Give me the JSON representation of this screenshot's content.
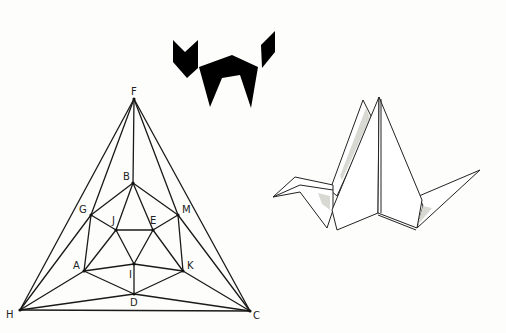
{
  "figures": {
    "cat": {
      "description": "black tangram-style cat silhouette",
      "color": "#000000",
      "head": [
        [
          173,
          40
        ],
        [
          185,
          52
        ],
        [
          198,
          40
        ],
        [
          198,
          68
        ],
        [
          187,
          78
        ],
        [
          173,
          62
        ]
      ],
      "body": [
        [
          199,
          67
        ],
        [
          232,
          55
        ],
        [
          258,
          67
        ],
        [
          251,
          108
        ],
        [
          240,
          75
        ],
        [
          222,
          78
        ],
        [
          210,
          107
        ]
      ],
      "tail": [
        [
          261,
          45
        ],
        [
          275,
          31
        ],
        [
          275,
          52
        ],
        [
          262,
          68
        ]
      ]
    },
    "graph": {
      "description": "planar graph: triangle with nested hexagon",
      "nodes": [
        {
          "id": "F",
          "x": 134,
          "y": 99,
          "lx": 131,
          "ly": 95,
          "label": "F"
        },
        {
          "id": "B",
          "x": 133,
          "y": 183,
          "lx": 123,
          "ly": 180,
          "label": "B"
        },
        {
          "id": "G",
          "x": 91,
          "y": 215,
          "lx": 79,
          "ly": 213,
          "label": "G"
        },
        {
          "id": "M",
          "x": 178,
          "y": 215,
          "lx": 182,
          "ly": 213,
          "label": "M"
        },
        {
          "id": "J",
          "x": 116,
          "y": 230,
          "lx": 112,
          "ly": 224,
          "label": "J"
        },
        {
          "id": "E",
          "x": 153,
          "y": 230,
          "lx": 150,
          "ly": 224,
          "label": "E"
        },
        {
          "id": "A",
          "x": 84,
          "y": 271,
          "lx": 73,
          "ly": 269,
          "label": "A"
        },
        {
          "id": "I",
          "x": 134,
          "y": 264,
          "lx": 129,
          "ly": 278,
          "label": "I"
        },
        {
          "id": "K",
          "x": 183,
          "y": 271,
          "lx": 187,
          "ly": 269,
          "label": "K"
        },
        {
          "id": "D",
          "x": 134,
          "y": 294,
          "lx": 130,
          "ly": 306,
          "label": "D"
        },
        {
          "id": "H",
          "x": 20,
          "y": 310,
          "lx": 6,
          "ly": 318,
          "label": "H"
        },
        {
          "id": "C",
          "x": 250,
          "y": 311,
          "lx": 253,
          "ly": 319,
          "label": "C"
        }
      ],
      "edges": [
        [
          "F",
          "H"
        ],
        [
          "F",
          "C"
        ],
        [
          "H",
          "C"
        ],
        [
          "F",
          "G"
        ],
        [
          "F",
          "B"
        ],
        [
          "F",
          "M"
        ],
        [
          "H",
          "G"
        ],
        [
          "H",
          "A"
        ],
        [
          "H",
          "D"
        ],
        [
          "C",
          "M"
        ],
        [
          "C",
          "K"
        ],
        [
          "C",
          "D"
        ],
        [
          "B",
          "G"
        ],
        [
          "B",
          "M"
        ],
        [
          "B",
          "J"
        ],
        [
          "B",
          "E"
        ],
        [
          "G",
          "J"
        ],
        [
          "G",
          "A"
        ],
        [
          "M",
          "E"
        ],
        [
          "M",
          "K"
        ],
        [
          "J",
          "E"
        ],
        [
          "J",
          "A"
        ],
        [
          "J",
          "I"
        ],
        [
          "E",
          "I"
        ],
        [
          "E",
          "K"
        ],
        [
          "A",
          "I"
        ],
        [
          "A",
          "D"
        ],
        [
          "I",
          "K"
        ],
        [
          "I",
          "D"
        ],
        [
          "K",
          "D"
        ]
      ]
    },
    "crane": {
      "description": "origami paper crane line drawing"
    }
  }
}
